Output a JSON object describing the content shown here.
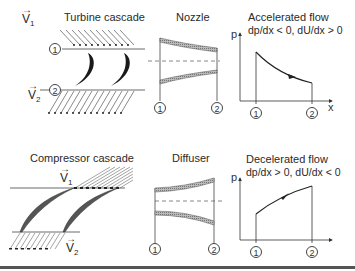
{
  "top_row": {
    "turbine_cascade": {
      "title": "Turbine cascade",
      "inlet_velocity": {
        "symbol": "V",
        "subscript": "1"
      },
      "outlet_velocity": {
        "symbol": "V",
        "subscript": "2"
      },
      "station_1": "1",
      "station_2": "2"
    },
    "nozzle": {
      "title": "Nozzle",
      "station_1": "1",
      "station_2": "2"
    },
    "accelerated_flow": {
      "title": "Accelerated flow",
      "condition": "dp/dx < 0,  dU/dx > 0",
      "y_axis": "p",
      "x_axis": "x",
      "station_1": "1",
      "station_2": "2"
    }
  },
  "bottom_row": {
    "compressor_cascade": {
      "title": "Compressor cascade",
      "inlet_velocity": {
        "symbol": "V",
        "subscript": "1"
      },
      "outlet_velocity": {
        "symbol": "V",
        "subscript": "2"
      }
    },
    "diffuser": {
      "title": "Diffuser",
      "station_1": "1",
      "station_2": "2"
    },
    "decelerated_flow": {
      "title": "Decelerated flow",
      "condition": "dp/dx > 0,  dU/dx < 0",
      "y_axis": "p",
      "station_1": "1",
      "station_2": "2"
    }
  },
  "arrow_glyph": "→",
  "colors": {
    "ink": "#222222",
    "hatch": "#777777",
    "blade": "#1a1a1a",
    "compressor_blade": "#666666"
  }
}
